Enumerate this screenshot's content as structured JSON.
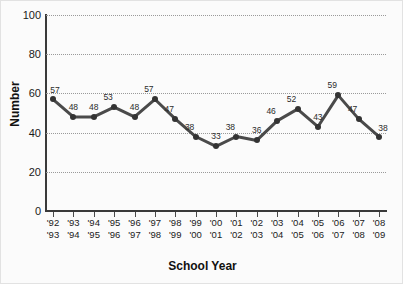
{
  "chart_data": {
    "type": "line",
    "title": "",
    "xlabel": "School Year",
    "ylabel": "Number",
    "ylim": [
      0,
      100
    ],
    "ytick_values": [
      100,
      80,
      60,
      40,
      20,
      0
    ],
    "ytick_labels": [
      "100",
      "80",
      "60",
      "40",
      "20",
      "0"
    ],
    "grid": true,
    "legend": "none",
    "line_color": "#4a4a4a",
    "marker_color": "#333333",
    "gridline_color": "#9a9a9a",
    "categories": [
      "'92\n'93",
      "'93\n'94",
      "'94\n'95",
      "'95\n'96",
      "'96\n'97",
      "'97\n'98",
      "'98\n'99",
      "'99\n'00",
      "'00\n'01",
      "'01\n'02",
      "'02\n'03",
      "'03\n'04",
      "'04\n'05",
      "'05\n'06",
      "'06\n'07",
      "'07\n'08",
      "'08\n'09"
    ],
    "values": [
      57,
      48,
      48,
      53,
      48,
      57,
      47,
      38,
      33,
      38,
      36,
      46,
      52,
      43,
      59,
      47,
      38
    ],
    "point_labels": [
      "57",
      "48",
      "48",
      "53",
      "48",
      "57",
      "47",
      "38",
      "33",
      "38",
      "36",
      "46",
      "52",
      "43",
      "59",
      "47",
      "38"
    ]
  }
}
